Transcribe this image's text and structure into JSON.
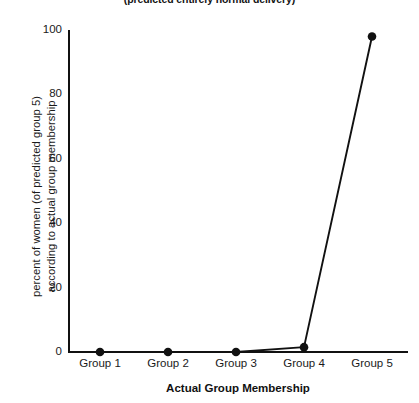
{
  "chart_data": {
    "type": "line",
    "title": "(predicted entirely normal delivery)",
    "xlabel": "Actual Group Membership",
    "ylabel_line1": "percent of women (of predicted group 5)",
    "ylabel_line2": "according to actual group membership",
    "categories": [
      "Group 1",
      "Group 2",
      "Group 3",
      "Group 4",
      "Group 5"
    ],
    "values": [
      0,
      0,
      0,
      1.5,
      98
    ],
    "ylim": [
      0,
      100
    ],
    "yticks": [
      0,
      20,
      40,
      60,
      80,
      100
    ],
    "ytick_labels": [
      "0",
      "20",
      "40",
      "60",
      "80",
      "100"
    ],
    "grid": false,
    "legend": false,
    "series_color": "#111111",
    "marker": "filled-circle",
    "marker_size": 7
  }
}
